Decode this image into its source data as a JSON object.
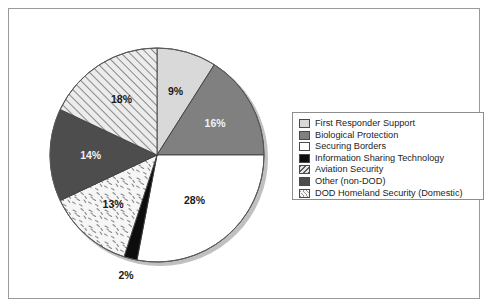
{
  "chart_data": {
    "type": "pie",
    "title": "",
    "subtitle": "",
    "xlabel": "",
    "ylabel": "",
    "legend_position": "right",
    "grid": false,
    "units": "percent",
    "start_angle_deg": 0,
    "direction": "clockwise",
    "categories": [
      "First Responder Support",
      "Biological Protection",
      "Securing Borders",
      "Information Sharing Technology",
      "DOD Homeland Security (Domestic)",
      "Other (non-DOD)",
      "Aviation Security"
    ],
    "values": [
      9,
      16,
      28,
      2,
      13,
      14,
      18
    ],
    "data_labels": [
      "9%",
      "16%",
      "28%",
      "2%",
      "13%",
      "14%",
      "18%"
    ],
    "slices": [
      {
        "label": "First Responder Support",
        "value": 9,
        "display": "9%",
        "fill": "#d9d9d9",
        "pattern": "solid",
        "label_color": "dark"
      },
      {
        "label": "Biological Protection",
        "value": 16,
        "display": "16%",
        "fill": "#808080",
        "pattern": "solid",
        "label_color": "light"
      },
      {
        "label": "Securing Borders",
        "value": 28,
        "display": "28%",
        "fill": "#ffffff",
        "pattern": "solid",
        "label_color": "dark"
      },
      {
        "label": "Information Sharing Technology",
        "value": 2,
        "display": "2%",
        "fill": "#0d0d0d",
        "pattern": "solid",
        "label_color": "dark"
      },
      {
        "label": "DOD Homeland Security (Domestic)",
        "value": 13,
        "display": "13%",
        "fill": "#f4f4f4",
        "pattern": "speckle",
        "label_color": "dark"
      },
      {
        "label": "Other (non-DOD)",
        "value": 14,
        "display": "14%",
        "fill": "#4d4d4d",
        "pattern": "solid",
        "label_color": "light"
      },
      {
        "label": "Aviation Security",
        "value": 18,
        "display": "18%",
        "fill": "#e6e6e6",
        "pattern": "diagonal-hatch",
        "label_color": "dark"
      }
    ]
  },
  "legend": {
    "items": [
      {
        "label": "First Responder Support",
        "swatch": "#d9d9d9",
        "pattern": "solid"
      },
      {
        "label": "Biological Protection",
        "swatch": "#808080",
        "pattern": "solid"
      },
      {
        "label": "Securing Borders",
        "swatch": "#ffffff",
        "pattern": "solid"
      },
      {
        "label": "Information Sharing Technology",
        "swatch": "#0d0d0d",
        "pattern": "solid"
      },
      {
        "label": "Aviation Security",
        "swatch": "#e6e6e6",
        "pattern": "diagonal-hatch"
      },
      {
        "label": "Other (non-DOD)",
        "swatch": "#4d4d4d",
        "pattern": "solid"
      },
      {
        "label": "DOD Homeland Security (Domestic)",
        "swatch": "#f4f4f4",
        "pattern": "speckle"
      }
    ]
  },
  "colors": {
    "frame_border": "#9a9a9a",
    "legend_border": "#8d8d8d",
    "slice_outline": "#3f3f3f",
    "text": "#1d1d1d",
    "background": "#ffffff"
  }
}
